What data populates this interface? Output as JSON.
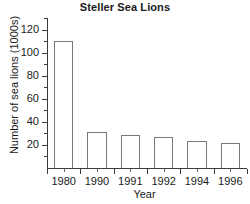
{
  "chart_data": {
    "type": "bar",
    "title": "Steller Sea Lions",
    "xlabel": "Year",
    "ylabel": "Number of sea lions (1000s)",
    "categories": [
      "1980",
      "1990",
      "1991",
      "1992",
      "1994",
      "1996"
    ],
    "values": [
      110,
      31,
      29,
      27,
      23,
      22
    ],
    "ylim": [
      0,
      130
    ],
    "ytick_labels": [
      "20",
      "40",
      "60",
      "80",
      "100",
      "120"
    ],
    "ytick_values": [
      20,
      40,
      60,
      80,
      100,
      120
    ],
    "ytick_minor_values": [
      10,
      30,
      50,
      70,
      90,
      110,
      130
    ],
    "grid": false,
    "legend": false,
    "bar_facecolor": "#ffffff",
    "bar_edgecolor": "#787878",
    "axis_color": "#3b3b3b",
    "text_color": "#1a1a1a",
    "background": "#ffffff"
  }
}
